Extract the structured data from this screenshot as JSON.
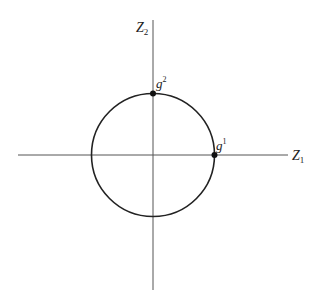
{
  "diagram": {
    "type": "unit-circle-axes",
    "axes": {
      "x": {
        "label": "Z",
        "subscript": "1"
      },
      "y": {
        "label": "Z",
        "subscript": "2"
      }
    },
    "circle": {
      "center": [
        0,
        0
      ],
      "radius": 1
    },
    "points": [
      {
        "label": "g",
        "superscript": "1",
        "position": "circle ∩ positive Z1 axis"
      },
      {
        "label": "g",
        "superscript": "2",
        "position": "circle ∩ positive Z2 axis"
      }
    ],
    "colors": {
      "stroke": "#222222",
      "axis": "#555555",
      "background": "#ffffff"
    }
  }
}
